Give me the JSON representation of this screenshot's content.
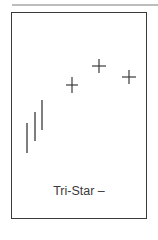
{
  "diagram": {
    "label": "Tri-Star –",
    "colors": {
      "stroke": "#3a3a3a",
      "frame": "#3a3a3a",
      "topline": "#bdbdbd"
    },
    "bars": [
      {
        "x": 27,
        "y1": 123,
        "y2": 153
      },
      {
        "x": 35,
        "y1": 112,
        "y2": 141
      },
      {
        "x": 42,
        "y1": 100,
        "y2": 130
      }
    ],
    "doji_stars": [
      {
        "cx": 72,
        "cy": 85,
        "half_w": 6,
        "half_h": 8
      },
      {
        "cx": 99,
        "cy": 66,
        "half_w": 7,
        "half_h": 7
      },
      {
        "cx": 129,
        "cy": 77,
        "half_w": 7,
        "half_h": 7
      }
    ]
  }
}
